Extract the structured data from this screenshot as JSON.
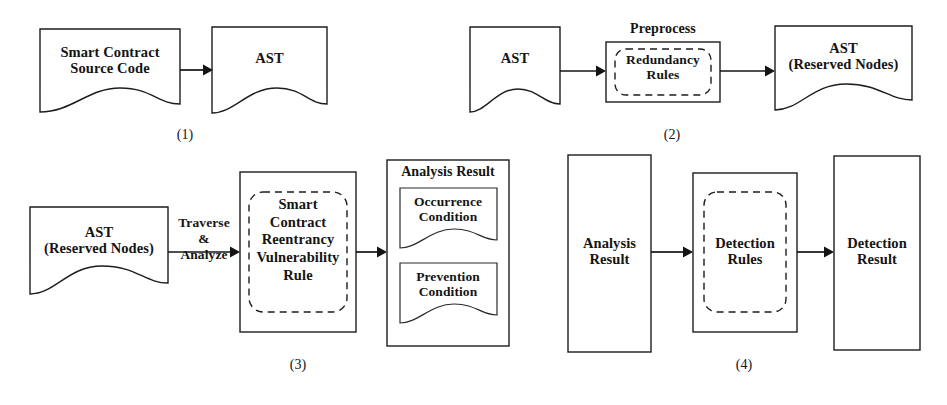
{
  "figure": {
    "type": "flow-diagram",
    "background_color": "#ffffff",
    "stroke_color": "#1d1d1d",
    "panels": [
      {
        "id": "panel-1",
        "number_label": "(1)",
        "nodes": [
          {
            "id": "smart-contract-source-code",
            "shape": "document",
            "text": "Smart Contract\nSource Code"
          },
          {
            "id": "ast-1",
            "shape": "document",
            "text": "AST"
          }
        ],
        "edges": [
          {
            "from": "smart-contract-source-code",
            "to": "ast-1",
            "label": ""
          }
        ]
      },
      {
        "id": "panel-2",
        "number_label": "(2)",
        "nodes": [
          {
            "id": "ast-2",
            "shape": "document",
            "text": "AST"
          },
          {
            "id": "preprocess",
            "shape": "process",
            "caption": "Preprocess",
            "inner": {
              "id": "redundancy-rules",
              "shape": "dashed-rounded",
              "text": "Redundancy\nRules"
            }
          },
          {
            "id": "ast-reserved-nodes-2",
            "shape": "document",
            "text": "AST\n(Reserved Nodes)"
          }
        ],
        "edges": [
          {
            "from": "ast-2",
            "to": "preprocess",
            "label": ""
          },
          {
            "from": "preprocess",
            "to": "ast-reserved-nodes-2",
            "label": ""
          }
        ]
      },
      {
        "id": "panel-3",
        "number_label": "(3)",
        "nodes": [
          {
            "id": "ast-reserved-nodes-3",
            "shape": "document",
            "text": "AST\n(Reserved Nodes)"
          },
          {
            "id": "rule-box",
            "shape": "process",
            "inner": {
              "id": "smart-contract-reentrancy-vulnerability-rule",
              "shape": "dashed-rounded",
              "text": "Smart\nContract\nReentrancy\nVulnerability\nRule"
            }
          },
          {
            "id": "analysis-result-container",
            "shape": "container",
            "caption": "Analysis Result",
            "children": [
              {
                "id": "occurrence-condition",
                "shape": "document",
                "text": "Occurrence\nCondition"
              },
              {
                "id": "prevention-condition",
                "shape": "document",
                "text": "Prevention\nCondition"
              }
            ]
          }
        ],
        "edges": [
          {
            "from": "ast-reserved-nodes-3",
            "to": "rule-box",
            "label": "Traverse\n&\nAnalyze"
          },
          {
            "from": "rule-box",
            "to": "analysis-result-container",
            "label": ""
          }
        ]
      },
      {
        "id": "panel-4",
        "number_label": "(4)",
        "nodes": [
          {
            "id": "analysis-result-4",
            "shape": "rect",
            "text": "Analysis\nResult"
          },
          {
            "id": "detection-rules-box",
            "shape": "process",
            "inner": {
              "id": "detection-rules",
              "shape": "dashed-rounded",
              "text": "Detection\nRules"
            }
          },
          {
            "id": "detection-result",
            "shape": "rect",
            "text": "Detection\nResult"
          }
        ],
        "edges": [
          {
            "from": "analysis-result-4",
            "to": "detection-rules-box",
            "label": ""
          },
          {
            "from": "detection-rules-box",
            "to": "detection-result",
            "label": ""
          }
        ]
      }
    ],
    "labels": {
      "p1_source": "Smart Contract\nSource Code",
      "p1_ast": "AST",
      "p1_num": "(1)",
      "p2_ast": "AST",
      "p2_preprocess": "Preprocess",
      "p2_redundancy": "Redundancy\nRules",
      "p2_ast_reserved": "AST\n(Reserved Nodes)",
      "p2_num": "(2)",
      "p3_ast_reserved": "AST\n(Reserved Nodes)",
      "p3_edge": "Traverse\n&\nAnalyze",
      "p3_rule": "Smart\nContract\nReentrancy\nVulnerability\nRule",
      "p3_analysis_result": "Analysis Result",
      "p3_occurrence": "Occurrence\nCondition",
      "p3_prevention": "Prevention\nCondition",
      "p3_num": "(3)",
      "p4_analysis_result": "Analysis\nResult",
      "p4_detection_rules": "Detection\nRules",
      "p4_detection_result": "Detection\nResult",
      "p4_num": "(4)"
    }
  }
}
